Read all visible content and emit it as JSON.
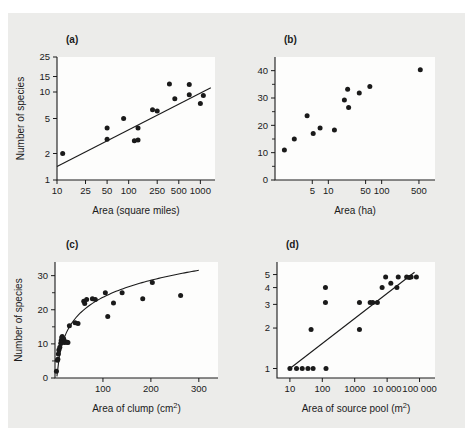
{
  "figure": {
    "background_color": "#ececea",
    "page_color": "#ffffff",
    "ink_color": "#1a1a1a",
    "plot_background": "#fdfdfc",
    "panel_count": 4
  },
  "chart_data": [
    {
      "id": "panel-a",
      "type": "scatter",
      "panel_label": "(a)",
      "title": "",
      "xlabel": "Area (square miles)",
      "ylabel": "Number of species",
      "xscale": "log",
      "yscale": "log",
      "xlim": [
        10,
        1600
      ],
      "ylim": [
        1,
        25
      ],
      "grid": false,
      "legend": null,
      "xticks": [
        10,
        25,
        50,
        100,
        250,
        500,
        1000
      ],
      "xticklabels": [
        "10",
        "25",
        "50",
        "100",
        "250",
        "500",
        "1000"
      ],
      "yticks": [
        1,
        2,
        5,
        10,
        15,
        25
      ],
      "yticklabels": [
        "1",
        "2",
        "5",
        "10",
        "15",
        "25"
      ],
      "points": [
        {
          "x": 12,
          "y": 2.0
        },
        {
          "x": 50,
          "y": 3.9
        },
        {
          "x": 50,
          "y": 2.9
        },
        {
          "x": 85,
          "y": 5.0
        },
        {
          "x": 120,
          "y": 2.8
        },
        {
          "x": 135,
          "y": 2.85
        },
        {
          "x": 135,
          "y": 3.9
        },
        {
          "x": 215,
          "y": 6.3
        },
        {
          "x": 250,
          "y": 6.1
        },
        {
          "x": 370,
          "y": 12.3
        },
        {
          "x": 440,
          "y": 8.4
        },
        {
          "x": 700,
          "y": 12.2
        },
        {
          "x": 700,
          "y": 9.3
        },
        {
          "x": 1000,
          "y": 7.4
        },
        {
          "x": 1100,
          "y": 9.1
        }
      ],
      "fit": {
        "kind": "loglog-line",
        "x_start": 10,
        "y_start": 1.42,
        "x_end": 1400,
        "y_end": 11.2
      }
    },
    {
      "id": "panel-b",
      "type": "scatter",
      "panel_label": "(b)",
      "title": "",
      "xlabel": "Area (ha)",
      "ylabel": "",
      "xscale": "log",
      "yscale": "linear",
      "xlim": [
        1,
        1000
      ],
      "ylim": [
        0,
        45
      ],
      "grid": false,
      "legend": null,
      "xticks": [
        5,
        10,
        50,
        100,
        500
      ],
      "xticklabels": [
        "5",
        "10",
        "50",
        "100",
        "500"
      ],
      "yticks": [
        0,
        10,
        20,
        30,
        40
      ],
      "yticklabels": [
        "0",
        "10",
        "20",
        "30",
        "40"
      ],
      "yminorticks": [
        5,
        15,
        25,
        35
      ],
      "points": [
        {
          "x": 1.5,
          "y": 11
        },
        {
          "x": 2.3,
          "y": 15
        },
        {
          "x": 4.0,
          "y": 23.5
        },
        {
          "x": 5.2,
          "y": 17
        },
        {
          "x": 7.0,
          "y": 19
        },
        {
          "x": 13,
          "y": 18.3
        },
        {
          "x": 20,
          "y": 29.3
        },
        {
          "x": 23,
          "y": 33.2
        },
        {
          "x": 24,
          "y": 26.5
        },
        {
          "x": 38,
          "y": 31.8
        },
        {
          "x": 60,
          "y": 34.2
        },
        {
          "x": 530,
          "y": 40.3
        }
      ],
      "fit": null
    },
    {
      "id": "panel-c",
      "type": "scatter",
      "panel_label": "(c)",
      "title": "",
      "xlabel": "Area of clump (cm2)",
      "xlabel_base": "Area of clump (cm",
      "xlabel_super": "2",
      "xlabel_tail": ")",
      "ylabel": "Number of species",
      "xscale": "linear",
      "yscale": "linear",
      "xlim": [
        0,
        340
      ],
      "ylim": [
        0,
        34
      ],
      "grid": false,
      "legend": null,
      "xticks": [
        100,
        200,
        300
      ],
      "xticklabels": [
        "100",
        "200",
        "300"
      ],
      "yticks": [
        0,
        10,
        20,
        30
      ],
      "yticklabels": [
        "0",
        "10",
        "20",
        "30"
      ],
      "yminorticks": [
        5,
        15,
        25
      ],
      "points": [
        {
          "x": 3,
          "y": 2.0
        },
        {
          "x": 5,
          "y": 5.2
        },
        {
          "x": 6,
          "y": 5.5
        },
        {
          "x": 7,
          "y": 7.0
        },
        {
          "x": 8,
          "y": 8.2
        },
        {
          "x": 10,
          "y": 9.0
        },
        {
          "x": 12,
          "y": 10.2
        },
        {
          "x": 13,
          "y": 11.0
        },
        {
          "x": 14,
          "y": 11.8
        },
        {
          "x": 15,
          "y": 12.2
        },
        {
          "x": 16,
          "y": 10.5
        },
        {
          "x": 18,
          "y": 11.5
        },
        {
          "x": 20,
          "y": 10.4
        },
        {
          "x": 22,
          "y": 10.6
        },
        {
          "x": 25,
          "y": 10.5
        },
        {
          "x": 27,
          "y": 10.4
        },
        {
          "x": 30,
          "y": 15.3
        },
        {
          "x": 42,
          "y": 16.2
        },
        {
          "x": 48,
          "y": 16.0
        },
        {
          "x": 60,
          "y": 22.5
        },
        {
          "x": 62,
          "y": 21.8
        },
        {
          "x": 66,
          "y": 23.0
        },
        {
          "x": 78,
          "y": 23.2
        },
        {
          "x": 84,
          "y": 23.0
        },
        {
          "x": 105,
          "y": 25.0
        },
        {
          "x": 110,
          "y": 18.0
        },
        {
          "x": 122,
          "y": 22.0
        },
        {
          "x": 140,
          "y": 25.0
        },
        {
          "x": 183,
          "y": 23.2
        },
        {
          "x": 203,
          "y": 28.0
        },
        {
          "x": 262,
          "y": 24.2
        }
      ],
      "fit": {
        "kind": "log-curve",
        "formula": "y = a + b*ln(x)",
        "a": -9.5,
        "b": 7.2,
        "x_start": 4,
        "x_end": 300
      }
    },
    {
      "id": "panel-d",
      "type": "scatter",
      "panel_label": "(d)",
      "title": "",
      "xlabel": "Area of source pool (m2)",
      "xlabel_base": "Area of source pool (m",
      "xlabel_super": "2",
      "xlabel_tail": ")",
      "ylabel": "",
      "xscale": "log",
      "yscale": "log",
      "xlim": [
        4,
        300000
      ],
      "ylim": [
        0.85,
        6.2
      ],
      "grid": false,
      "legend": null,
      "xticks": [
        10,
        100,
        1000,
        10000,
        100000
      ],
      "xticklabels": [
        "10",
        "100",
        "1000",
        "10 000",
        "100 000"
      ],
      "yticks": [
        1,
        2,
        3,
        4,
        5
      ],
      "yticklabels": [
        "1",
        "2",
        "3",
        "4",
        "5"
      ],
      "points": [
        {
          "x": 10,
          "y": 1.0
        },
        {
          "x": 16,
          "y": 1.0
        },
        {
          "x": 24,
          "y": 1.0
        },
        {
          "x": 36,
          "y": 1.0
        },
        {
          "x": 52,
          "y": 1.0
        },
        {
          "x": 130,
          "y": 1.0
        },
        {
          "x": 45,
          "y": 1.95
        },
        {
          "x": 125,
          "y": 4.0
        },
        {
          "x": 125,
          "y": 3.1
        },
        {
          "x": 1400,
          "y": 1.95
        },
        {
          "x": 1400,
          "y": 3.1
        },
        {
          "x": 3000,
          "y": 3.1
        },
        {
          "x": 3600,
          "y": 3.1
        },
        {
          "x": 5000,
          "y": 3.1
        },
        {
          "x": 7000,
          "y": 4.0
        },
        {
          "x": 9000,
          "y": 4.8
        },
        {
          "x": 13000,
          "y": 4.3
        },
        {
          "x": 20000,
          "y": 4.0
        },
        {
          "x": 22000,
          "y": 4.8
        },
        {
          "x": 40000,
          "y": 4.8
        },
        {
          "x": 48000,
          "y": 4.75
        },
        {
          "x": 55000,
          "y": 4.8
        },
        {
          "x": 80000,
          "y": 4.8
        }
      ],
      "fit": {
        "kind": "loglog-line",
        "x_start": 10,
        "y_start": 1.0,
        "x_end": 70000,
        "y_end": 5.2
      }
    }
  ]
}
